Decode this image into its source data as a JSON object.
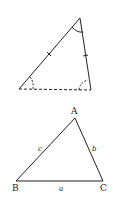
{
  "figure_top": {
    "description": "Triangle with two tick-marked equal sides, dashed base, and angle arcs at all three vertices",
    "vertices": {
      "top": [
        80,
        18
      ],
      "bottom_left": [
        19,
        89
      ],
      "bottom_right": [
        91,
        90
      ]
    },
    "base_style": "dashed",
    "tick_marks": 2,
    "angle_arcs": [
      "top",
      "bottom_left",
      "bottom_right"
    ],
    "stroke_color": "#222222"
  },
  "figure_bottom": {
    "vertices": {
      "A": [
        75,
        118
      ],
      "B": [
        16,
        181
      ],
      "C": [
        103,
        181
      ]
    },
    "vertex_labels": {
      "A": "A",
      "B": "B",
      "C": "C"
    },
    "side_labels": {
      "a": "a",
      "b": "b",
      "c": "c"
    },
    "stroke_color": "#222222"
  }
}
